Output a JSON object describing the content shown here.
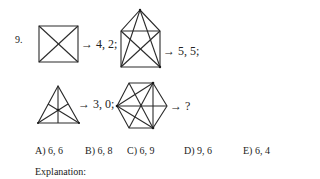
{
  "question": {
    "number": "9.",
    "figures": [
      {
        "id": "square-with-diagonals",
        "result": "→ 4, 2;"
      },
      {
        "id": "house-pentagon-star",
        "result": "→ 5, 5;"
      },
      {
        "id": "triangle-with-medians",
        "result": "→ 3, 0;"
      },
      {
        "id": "hexagon-with-diagonals",
        "result": "→ ?"
      }
    ],
    "options": [
      {
        "label": "A) 6, 6"
      },
      {
        "label": "B) 6, 8"
      },
      {
        "label": "C) 6, 9"
      },
      {
        "label": "D) 9, 6"
      },
      {
        "label": "E) 6, 4"
      }
    ],
    "explanation_label": "Explanation:"
  }
}
